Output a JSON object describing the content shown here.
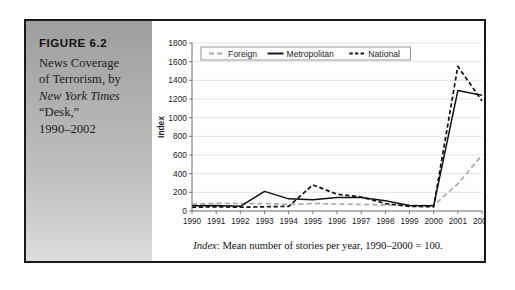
{
  "figure": {
    "label": "FIGURE 6.2",
    "caption_lines": [
      {
        "text": "News Coverage",
        "italic": false
      },
      {
        "text": "of Terrorism, by",
        "italic": false
      },
      {
        "text": "New York Times",
        "italic": true
      },
      {
        "text": "“Desk,”",
        "italic": false
      },
      {
        "text": "1990–2002",
        "italic": false
      }
    ]
  },
  "footnote": {
    "lead": "Index",
    "rest": ": Mean number of stories per year, 1990–2000 = 100."
  },
  "colors": {
    "frame": "#1a1a1a",
    "panel_top": "#9e9e9e",
    "panel_bottom": "#dedede",
    "foreign": "#a9a9a9",
    "metropolitan": "#111111",
    "national": "#111111",
    "gridline": "#d8d8d8",
    "axis": "#5a5a5a"
  },
  "chart_data": {
    "type": "line",
    "title": "",
    "xlabel": "",
    "ylabel": "Index",
    "ylim": [
      0,
      1800
    ],
    "ytick_step": 200,
    "yticks": [
      0,
      200,
      400,
      600,
      800,
      1000,
      1200,
      1400,
      1600,
      1800
    ],
    "grid": true,
    "legend_position": "top-left",
    "categories": [
      "1990",
      "1991",
      "1992",
      "1993",
      "1994",
      "1995",
      "1996",
      "1997",
      "1998",
      "1999",
      "2000",
      "2001",
      "2002"
    ],
    "x": [
      1990,
      1991,
      1992,
      1993,
      1994,
      1995,
      1996,
      1997,
      1998,
      1999,
      2000,
      2001,
      2002
    ],
    "series": [
      {
        "name": "Foreign",
        "color": "#a9a9a9",
        "style": "dashed",
        "values": [
          70,
          85,
          80,
          80,
          70,
          80,
          75,
          70,
          65,
          60,
          60,
          290,
          600
        ]
      },
      {
        "name": "Metropolitan",
        "color": "#111111",
        "style": "solid",
        "values": [
          55,
          60,
          50,
          210,
          130,
          120,
          145,
          145,
          110,
          60,
          55,
          1290,
          1240
        ]
      },
      {
        "name": "National",
        "color": "#111111",
        "style": "dashed",
        "values": [
          40,
          45,
          40,
          45,
          50,
          280,
          180,
          150,
          80,
          50,
          45,
          1550,
          1180
        ]
      }
    ]
  }
}
